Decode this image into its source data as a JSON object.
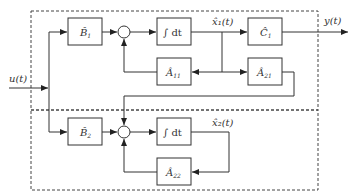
{
  "diagram": {
    "type": "block-diagram",
    "signals": {
      "input": "u(t)",
      "output": "y(t)",
      "state1": "x̂₁(t)",
      "state2": "x̂₂(t)"
    },
    "subsystems": [
      {
        "id": "subsystem-1",
        "blocks": {
          "input_gain": {
            "base": "B̂",
            "sub": "1"
          },
          "integrator": "∫ dt",
          "feedback": {
            "base": "Â",
            "sub": "11"
          },
          "output_gain": {
            "base": "Ĉ",
            "sub": "1"
          },
          "coupling": {
            "base": "Â",
            "sub": "21"
          }
        }
      },
      {
        "id": "subsystem-2",
        "blocks": {
          "input_gain": {
            "base": "B̂",
            "sub": "2"
          },
          "integrator": "∫ dt",
          "feedback": {
            "base": "Â",
            "sub": "22"
          }
        }
      }
    ],
    "colors": {
      "line": "#333333",
      "dashed_border": "#444444",
      "background": "#ffffff"
    }
  }
}
